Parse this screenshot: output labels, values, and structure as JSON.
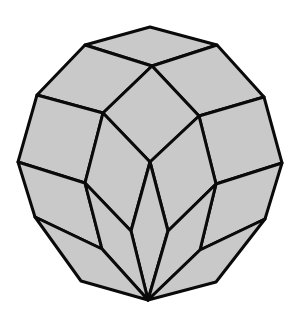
{
  "figure": {
    "type": "polyhedral tiling",
    "fill_color": "#c9c9c9",
    "stroke_color": "#0a0a0a",
    "background_color": "#ffffff",
    "face_count": 14
  }
}
